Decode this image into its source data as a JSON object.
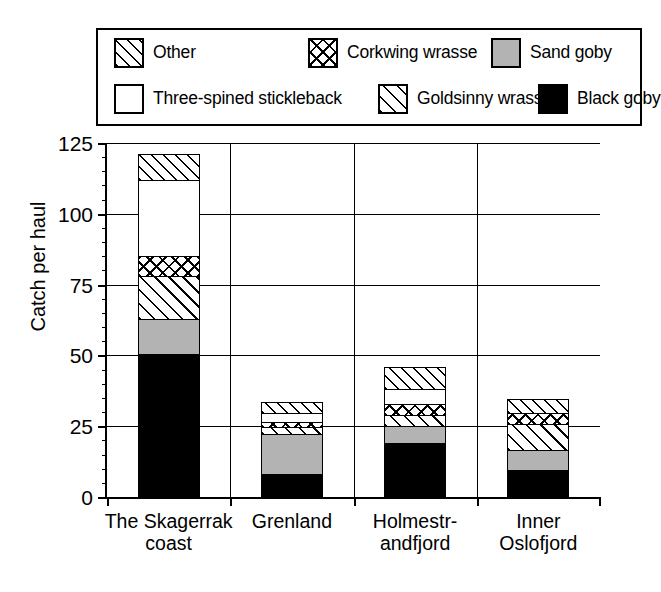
{
  "chart_data": {
    "type": "bar",
    "subtype": "stacked-bar",
    "title": "",
    "xlabel": "",
    "ylabel": "Catch per haul",
    "ylim": [
      0,
      125
    ],
    "yticks": [
      0,
      25,
      50,
      75,
      100,
      125
    ],
    "ytick_labels": [
      "0",
      "25",
      "50",
      "75",
      "100",
      "125"
    ],
    "minor_tick_interval": 5,
    "grid": true,
    "legend_position": "above-plot",
    "categories": [
      "The Skagerrak\ncoast",
      "Grenland",
      "Holmestr-\nandfjord",
      "Inner\nOslofjord"
    ],
    "series": [
      {
        "name": "Black goby",
        "pattern": "solid-black",
        "color": "#000000",
        "values": [
          50.5,
          8.2,
          19.0,
          9.5
        ]
      },
      {
        "name": "Sand goby",
        "pattern": "solid-grey",
        "color": "#b3b3b3",
        "values": [
          12.5,
          14.1,
          6.0,
          7.0
        ]
      },
      {
        "name": "Goldsinny wrasse",
        "pattern": "hatch-narrow",
        "color": "#ffffff",
        "values": [
          15.0,
          2.5,
          4.0,
          9.2
        ]
      },
      {
        "name": "Corkwing wrasse",
        "pattern": "crosshatch",
        "color": "#ffffff",
        "values": [
          7.0,
          1.8,
          4.0,
          3.9
        ]
      },
      {
        "name": "Three-spined stickleback",
        "pattern": "plain-white",
        "color": "#ffffff",
        "values": [
          27.0,
          2.9,
          5.0,
          0.0
        ]
      },
      {
        "name": "Other",
        "pattern": "hatch-wide",
        "color": "#ffffff",
        "values": [
          9.0,
          4.1,
          8.0,
          5.0
        ]
      }
    ],
    "totals": [
      121.0,
      33.6,
      46.0,
      34.6
    ]
  },
  "legend": {
    "items": [
      {
        "label": "Other",
        "swatch": "hatch-wide-swatch"
      },
      {
        "label": "Corkwing wrasse",
        "swatch": "crosshatch-swatch"
      },
      {
        "label": "Sand goby",
        "swatch": "grey-swatch"
      },
      {
        "label": "Three-spined stickleback",
        "swatch": "white-swatch"
      },
      {
        "label": "Goldsinny wrasse",
        "swatch": "hatch-narrow-swatch"
      },
      {
        "label": "Black goby",
        "swatch": "black-swatch"
      }
    ]
  },
  "axis": {
    "y_label": "Catch per haul",
    "y_tick_labels": [
      "125",
      "100",
      "75",
      "50",
      "25",
      "0"
    ],
    "x_tick_labels": [
      "The Skagerrak\ncoast",
      "Grenland",
      "Holmestr-\nandfjord",
      "Inner\nOslofjord"
    ]
  }
}
